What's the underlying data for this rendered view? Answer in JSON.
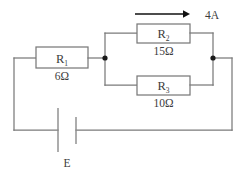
{
  "diagram": {
    "type": "electrical-circuit-schematic",
    "title_fragment": "",
    "components": {
      "r1": {
        "label": "R",
        "subscript": "1",
        "value": "6Ω"
      },
      "r2": {
        "label": "R",
        "subscript": "2",
        "value": "15Ω"
      },
      "r3": {
        "label": "R",
        "subscript": "3",
        "value": "10Ω"
      },
      "battery": {
        "label": "E"
      }
    },
    "annotations": {
      "current_arrow_label": "4A"
    },
    "colors": {
      "background": "#ffffff",
      "wire": "#7a7a7a",
      "text": "#3c3c3c",
      "arrow": "#111111",
      "node": "#1a1a1a"
    }
  }
}
